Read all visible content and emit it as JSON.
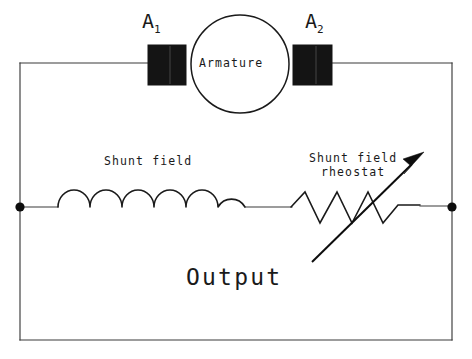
{
  "diagram": {
    "background_color": "#ffffff",
    "line_color": "#1a1a1a",
    "labels": {
      "brush_left": "A",
      "brush_left_sub": "1",
      "brush_right": "A",
      "brush_right_sub": "2",
      "armature": "Armature",
      "shunt_field": "Shunt field",
      "rheostat_line1": "Shunt field",
      "rheostat_line2": "rheostat",
      "output": "Output"
    },
    "components": {
      "armature": {
        "name": "armature",
        "shape": "circle",
        "cx": 240,
        "cy": 64,
        "r": 49
      },
      "brush_left": {
        "name": "brush-left",
        "shape": "rect",
        "x": 148,
        "y": 45,
        "width": 38,
        "height": 40,
        "fill": "#141414"
      },
      "brush_right": {
        "name": "brush-right",
        "shape": "rect",
        "x": 293,
        "y": 45,
        "width": 39,
        "height": 40,
        "fill": "#141414"
      },
      "shunt_field_coil": {
        "name": "inductor",
        "humps": 6,
        "x_start": 57,
        "x_end": 245,
        "baseline_y": 207,
        "hump_height": 18
      },
      "rheostat": {
        "name": "variable-resistor",
        "zigzag_peaks": 4,
        "x_start": 291,
        "x_end": 420,
        "baseline_y": 207,
        "peak_y": 192,
        "valley_y": 223
      },
      "adjust_arrow": {
        "name": "rheostat-adjust-arrow",
        "tail_x": 312,
        "tail_y": 262,
        "tip_x": 424,
        "tip_y": 152
      },
      "node_left": {
        "name": "terminal-node-left",
        "cx": 20,
        "cy": 207,
        "r": 4.6
      },
      "node_right": {
        "name": "terminal-node-right",
        "cx": 452,
        "cy": 207,
        "r": 4.6
      },
      "outer_loop": {
        "name": "outer-conductor-loop",
        "left_x": 20,
        "right_x": 452,
        "top_y": 63,
        "bottom_y": 340
      }
    }
  }
}
